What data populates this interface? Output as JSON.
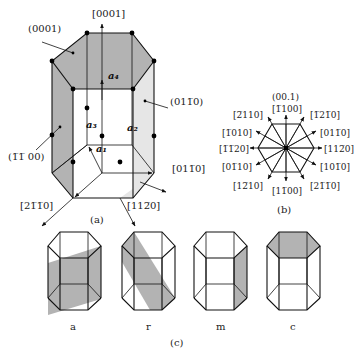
{
  "panel_a": {
    "caption": "(a)",
    "planes": {
      "basal": "(0001)",
      "prism_left": "(1̅1̅ 00)",
      "prism_right": "(011̅0)"
    },
    "directions": {
      "c_axis": "[0001]",
      "d_2110": "[21̅1̅0]",
      "d_1120": "[112̅0]",
      "d_0110": "[011̅0]"
    },
    "vectors": {
      "a1": "a₁",
      "a2": "a₂",
      "a3": "a₃",
      "c": "a₄"
    }
  },
  "panel_b": {
    "caption": "(b)",
    "title": "(00.1)",
    "directions": [
      "[1̅100]",
      "[1̅21̅0]",
      "[011̅0]",
      "[112̅0]",
      "[101̅0]",
      "[21̅1̅0]",
      "[11̅00]",
      "[12̅10]",
      "[01̅10]",
      "[1̅1̅20]",
      "[1̅010]",
      "[2̅110]"
    ]
  },
  "panel_c": {
    "caption": "(c)",
    "planes": [
      {
        "label": "a"
      },
      {
        "label": "r"
      },
      {
        "label": "m"
      },
      {
        "label": "c"
      }
    ]
  }
}
